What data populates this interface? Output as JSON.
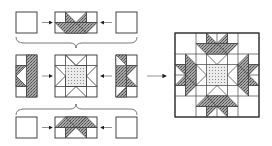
{
  "diagram": {
    "colors": {
      "line": "#333333",
      "fabric_dark": "#9a9a9a",
      "fabric_center": "#e6e6e6",
      "background": "#ffffff"
    },
    "rows": [
      {
        "name": "top-row",
        "units": [
          "corner-square",
          "star-point-unit",
          "corner-square"
        ]
      },
      {
        "name": "middle-row",
        "units": [
          "star-point-unit-vertical",
          "center-star-block",
          "star-point-unit-vertical"
        ]
      },
      {
        "name": "bottom-row",
        "units": [
          "corner-square",
          "star-point-unit",
          "corner-square"
        ]
      }
    ],
    "arrows": [
      "join-arrow-right",
      "join-arrow-left",
      "result-arrow"
    ],
    "result": "finished-star-block"
  }
}
